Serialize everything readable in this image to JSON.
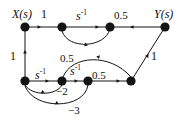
{
  "diagram": {
    "ink_color": "#141414",
    "background_color": "#ffffff",
    "nodes": [
      {
        "id": "x",
        "label": "X(s)",
        "cx": 25,
        "cy": 27,
        "r": 4.6
      },
      {
        "id": "n2",
        "label": "",
        "cx": 62,
        "cy": 27,
        "r": 4.6
      },
      {
        "id": "n3",
        "label": "",
        "cx": 110,
        "cy": 27,
        "r": 4.6
      },
      {
        "id": "y",
        "label": "Y(s)",
        "cx": 165,
        "cy": 27,
        "r": 4.6
      },
      {
        "id": "n5",
        "label": "",
        "cx": 25,
        "cy": 81,
        "r": 4.6
      },
      {
        "id": "n6",
        "label": "",
        "cx": 62,
        "cy": 81,
        "r": 4.6
      },
      {
        "id": "n7",
        "label": "",
        "cx": 88,
        "cy": 81,
        "r": 4.6
      },
      {
        "id": "n8",
        "label": "",
        "cx": 131,
        "cy": 81,
        "r": 4.6
      }
    ],
    "edges": [
      {
        "from": "x",
        "to": "n2",
        "gain": "1",
        "kind": "straight"
      },
      {
        "from": "n2",
        "to": "n3",
        "gain": "s^-1",
        "kind": "straight"
      },
      {
        "from": "y",
        "to": "n3",
        "gain": "0.5",
        "kind": "straight"
      },
      {
        "from": "n3",
        "to": "n2",
        "gain": "",
        "kind": "curve-down"
      },
      {
        "from": "n5",
        "to": "x",
        "gain": "1",
        "kind": "vertical"
      },
      {
        "from": "n5",
        "to": "n6",
        "gain": "s^-1",
        "kind": "straight"
      },
      {
        "from": "n6",
        "to": "n7",
        "gain": "s^-1",
        "kind": "straight"
      },
      {
        "from": "n7",
        "to": "n8",
        "gain": "0.5",
        "kind": "straight"
      },
      {
        "from": "n8",
        "to": "y",
        "gain": "1",
        "kind": "diagonal"
      },
      {
        "from": "n6",
        "to": "n8",
        "gain": "0.5",
        "kind": "curve-up"
      },
      {
        "from": "n6",
        "to": "n5",
        "gain": "-2",
        "kind": "curve-back-small"
      },
      {
        "from": "n7",
        "to": "n5",
        "gain": "-3",
        "kind": "curve-back-large"
      }
    ],
    "labels": [
      {
        "name": "input-label",
        "text": "X(s)",
        "x": 12,
        "y": 8,
        "size": 12,
        "italic": true
      },
      {
        "name": "output-label",
        "text": "Y(s)",
        "x": 154,
        "y": 8,
        "size": 12,
        "italic": true
      },
      {
        "name": "gain-top-1",
        "text": "1",
        "x": 41,
        "y": 8,
        "size": 12,
        "italic": false
      },
      {
        "name": "gain-top-s-inv",
        "text": "s",
        "x": 76,
        "y": 9,
        "size": 12,
        "italic": true,
        "sup": "-1"
      },
      {
        "name": "gain-top-half",
        "text": "0.5",
        "x": 114,
        "y": 10,
        "size": 11,
        "italic": false
      },
      {
        "name": "gain-left-1",
        "text": "1",
        "x": 10,
        "y": 50,
        "size": 12,
        "italic": false
      },
      {
        "name": "gain-right-1",
        "text": "1",
        "x": 151,
        "y": 50,
        "size": 12,
        "italic": false
      },
      {
        "name": "gain-mid-half",
        "text": "0.5",
        "x": 60,
        "y": 53,
        "size": 11,
        "italic": false
      },
      {
        "name": "gain-bottom-s-inv-1",
        "text": "s",
        "x": 35,
        "y": 68,
        "size": 12,
        "italic": true,
        "sup": "-1"
      },
      {
        "name": "gain-bottom-s-inv-2",
        "text": "s",
        "x": 70,
        "y": 64,
        "size": 12,
        "italic": true,
        "sup": "-1"
      },
      {
        "name": "gain-bottom-half",
        "text": "0.5",
        "x": 92,
        "y": 70,
        "size": 11,
        "italic": false
      },
      {
        "name": "gain-neg-two",
        "text": "−2",
        "x": 56,
        "y": 86,
        "size": 11,
        "italic": false
      },
      {
        "name": "gain-neg-three",
        "text": "−3",
        "x": 68,
        "y": 105,
        "size": 11,
        "italic": false
      }
    ]
  }
}
